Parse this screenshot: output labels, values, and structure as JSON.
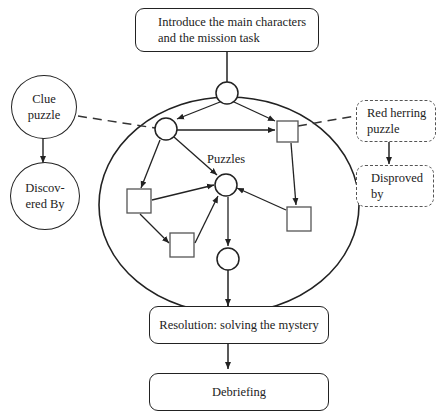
{
  "diagram": {
    "intro": "Introduce the main characters and the mission task",
    "intro_line1": "Introduce the main characters",
    "intro_line2": "and the mission task",
    "puzzles_label": "Puzzles",
    "clue_puzzle_line1": "Clue",
    "clue_puzzle_line2": "puzzle",
    "discovered_by_line1": "Discov-",
    "discovered_by_line2": "ered By",
    "red_herring_line1": "Red herring",
    "red_herring_line2": "puzzle",
    "disproved_by_line1": "Disproved",
    "disproved_by_line2": "by",
    "resolution": "Resolution: solving the mystery",
    "debriefing": "Debriefing"
  }
}
